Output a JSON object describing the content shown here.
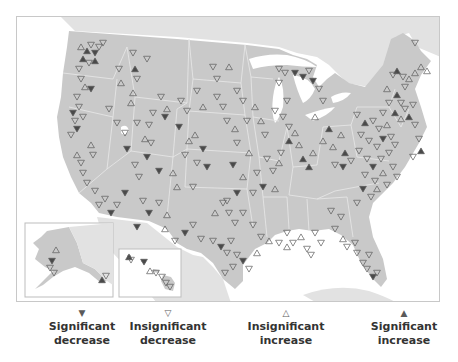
{
  "colors": {
    "land": "#c9c9c9",
    "neighbor_land": "#e2e2e2",
    "water": "#ffffff",
    "state_border": "#e8e8e8",
    "frame": "#c8c8c8",
    "marker_stroke": "#5a5a5a",
    "marker_fill_significant": "#4a4a4a"
  },
  "legend": {
    "items": [
      {
        "symbol": "▼",
        "line1": "Significant",
        "line2": "decrease",
        "type": "sig-dec"
      },
      {
        "symbol": "▽",
        "line1": "Insignificant",
        "line2": "decrease",
        "type": "insig-dec"
      },
      {
        "symbol": "△",
        "line1": "Insignificant",
        "line2": "increase",
        "type": "insig-inc"
      },
      {
        "symbol": "▲",
        "line1": "Significant",
        "line2": "increase",
        "type": "sig-inc"
      }
    ]
  },
  "insets": [
    {
      "name": "alaska",
      "x": 8,
      "y": 206,
      "w": 88,
      "h": 74
    },
    {
      "name": "hawaii",
      "x": 102,
      "y": 232,
      "w": 62,
      "h": 48
    }
  ],
  "markers": [
    {
      "x": 64,
      "y": 30,
      "t": "insig-inc"
    },
    {
      "x": 70,
      "y": 34,
      "t": "sig-inc"
    },
    {
      "x": 74,
      "y": 28,
      "t": "insig-dec"
    },
    {
      "x": 78,
      "y": 36,
      "t": "sig-dec"
    },
    {
      "x": 82,
      "y": 30,
      "t": "insig-dec"
    },
    {
      "x": 66,
      "y": 42,
      "t": "sig-inc"
    },
    {
      "x": 72,
      "y": 46,
      "t": "insig-dec"
    },
    {
      "x": 62,
      "y": 52,
      "t": "insig-dec"
    },
    {
      "x": 78,
      "y": 44,
      "t": "sig-inc"
    },
    {
      "x": 86,
      "y": 26,
      "t": "insig-dec"
    },
    {
      "x": 64,
      "y": 62,
      "t": "insig-dec"
    },
    {
      "x": 68,
      "y": 70,
      "t": "insig-inc"
    },
    {
      "x": 74,
      "y": 72,
      "t": "sig-dec"
    },
    {
      "x": 60,
      "y": 80,
      "t": "insig-dec"
    },
    {
      "x": 62,
      "y": 90,
      "t": "insig-dec"
    },
    {
      "x": 56,
      "y": 96,
      "t": "sig-dec"
    },
    {
      "x": 58,
      "y": 104,
      "t": "insig-dec"
    },
    {
      "x": 60,
      "y": 112,
      "t": "sig-dec"
    },
    {
      "x": 54,
      "y": 118,
      "t": "insig-dec"
    },
    {
      "x": 66,
      "y": 100,
      "t": "insig-dec"
    },
    {
      "x": 74,
      "y": 128,
      "t": "insig-inc"
    },
    {
      "x": 76,
      "y": 138,
      "t": "insig-dec"
    },
    {
      "x": 60,
      "y": 138,
      "t": "insig-inc"
    },
    {
      "x": 64,
      "y": 146,
      "t": "insig-dec"
    },
    {
      "x": 66,
      "y": 156,
      "t": "insig-dec"
    },
    {
      "x": 70,
      "y": 166,
      "t": "insig-dec"
    },
    {
      "x": 78,
      "y": 174,
      "t": "insig-dec"
    },
    {
      "x": 116,
      "y": 36,
      "t": "insig-dec"
    },
    {
      "x": 102,
      "y": 52,
      "t": "insig-dec"
    },
    {
      "x": 118,
      "y": 52,
      "t": "sig-inc"
    },
    {
      "x": 120,
      "y": 62,
      "t": "insig-dec"
    },
    {
      "x": 104,
      "y": 66,
      "t": "insig-inc"
    },
    {
      "x": 116,
      "y": 76,
      "t": "insig-inc"
    },
    {
      "x": 114,
      "y": 86,
      "t": "insig-inc"
    },
    {
      "x": 92,
      "y": 92,
      "t": "insig-dec"
    },
    {
      "x": 100,
      "y": 106,
      "t": "insig-dec"
    },
    {
      "x": 108,
      "y": 116,
      "t": "insig-dec"
    },
    {
      "x": 120,
      "y": 106,
      "t": "insig-dec"
    },
    {
      "x": 130,
      "y": 42,
      "t": "insig-dec"
    },
    {
      "x": 144,
      "y": 80,
      "t": "insig-dec"
    },
    {
      "x": 150,
      "y": 92,
      "t": "insig-inc"
    },
    {
      "x": 136,
      "y": 96,
      "t": "insig-dec"
    },
    {
      "x": 148,
      "y": 100,
      "t": "sig-dec"
    },
    {
      "x": 132,
      "y": 108,
      "t": "insig-dec"
    },
    {
      "x": 128,
      "y": 122,
      "t": "insig-inc"
    },
    {
      "x": 134,
      "y": 126,
      "t": "insig-dec"
    },
    {
      "x": 110,
      "y": 132,
      "t": "sig-dec"
    },
    {
      "x": 130,
      "y": 140,
      "t": "sig-dec"
    },
    {
      "x": 118,
      "y": 148,
      "t": "insig-dec"
    },
    {
      "x": 122,
      "y": 160,
      "t": "insig-dec"
    },
    {
      "x": 142,
      "y": 154,
      "t": "sig-dec"
    },
    {
      "x": 156,
      "y": 156,
      "t": "insig-inc"
    },
    {
      "x": 164,
      "y": 84,
      "t": "insig-dec"
    },
    {
      "x": 170,
      "y": 94,
      "t": "insig-dec"
    },
    {
      "x": 180,
      "y": 74,
      "t": "insig-dec"
    },
    {
      "x": 186,
      "y": 90,
      "t": "insig-inc"
    },
    {
      "x": 162,
      "y": 110,
      "t": "sig-dec"
    },
    {
      "x": 172,
      "y": 124,
      "t": "insig-inc"
    },
    {
      "x": 178,
      "y": 118,
      "t": "insig-inc"
    },
    {
      "x": 186,
      "y": 132,
      "t": "sig-dec"
    },
    {
      "x": 168,
      "y": 138,
      "t": "insig-dec"
    },
    {
      "x": 180,
      "y": 146,
      "t": "insig-dec"
    },
    {
      "x": 190,
      "y": 150,
      "t": "sig-dec"
    },
    {
      "x": 160,
      "y": 170,
      "t": "insig-inc"
    },
    {
      "x": 176,
      "y": 170,
      "t": "insig-dec"
    },
    {
      "x": 196,
      "y": 50,
      "t": "insig-dec"
    },
    {
      "x": 200,
      "y": 62,
      "t": "insig-dec"
    },
    {
      "x": 212,
      "y": 50,
      "t": "insig-inc"
    },
    {
      "x": 200,
      "y": 80,
      "t": "insig-dec"
    },
    {
      "x": 206,
      "y": 90,
      "t": "insig-dec"
    },
    {
      "x": 220,
      "y": 74,
      "t": "insig-dec"
    },
    {
      "x": 226,
      "y": 84,
      "t": "insig-dec"
    },
    {
      "x": 210,
      "y": 104,
      "t": "insig-dec"
    },
    {
      "x": 218,
      "y": 112,
      "t": "insig-inc"
    },
    {
      "x": 230,
      "y": 104,
      "t": "insig-dec"
    },
    {
      "x": 238,
      "y": 90,
      "t": "insig-inc"
    },
    {
      "x": 244,
      "y": 104,
      "t": "insig-inc"
    },
    {
      "x": 248,
      "y": 118,
      "t": "insig-dec"
    },
    {
      "x": 220,
      "y": 126,
      "t": "insig-dec"
    },
    {
      "x": 232,
      "y": 136,
      "t": "insig-inc"
    },
    {
      "x": 216,
      "y": 148,
      "t": "sig-dec"
    },
    {
      "x": 226,
      "y": 160,
      "t": "insig-inc"
    },
    {
      "x": 240,
      "y": 156,
      "t": "insig-dec"
    },
    {
      "x": 250,
      "y": 142,
      "t": "insig-dec"
    },
    {
      "x": 256,
      "y": 154,
      "t": "insig-dec"
    },
    {
      "x": 262,
      "y": 146,
      "t": "insig-inc"
    },
    {
      "x": 246,
      "y": 170,
      "t": "sig-dec"
    },
    {
      "x": 258,
      "y": 172,
      "t": "insig-inc"
    },
    {
      "x": 236,
      "y": 176,
      "t": "insig-dec"
    },
    {
      "x": 220,
      "y": 176,
      "t": "sig-dec"
    },
    {
      "x": 210,
      "y": 184,
      "t": "insig-dec"
    },
    {
      "x": 262,
      "y": 52,
      "t": "insig-dec"
    },
    {
      "x": 268,
      "y": 56,
      "t": "insig-dec"
    },
    {
      "x": 262,
      "y": 66,
      "t": "insig-dec"
    },
    {
      "x": 278,
      "y": 56,
      "t": "sig-dec"
    },
    {
      "x": 286,
      "y": 60,
      "t": "sig-dec"
    },
    {
      "x": 292,
      "y": 54,
      "t": "insig-dec"
    },
    {
      "x": 296,
      "y": 64,
      "t": "sig-dec"
    },
    {
      "x": 270,
      "y": 84,
      "t": "insig-dec"
    },
    {
      "x": 258,
      "y": 94,
      "t": "insig-dec"
    },
    {
      "x": 266,
      "y": 100,
      "t": "insig-dec"
    },
    {
      "x": 272,
      "y": 110,
      "t": "insig-dec"
    },
    {
      "x": 278,
      "y": 116,
      "t": "insig-inc"
    },
    {
      "x": 272,
      "y": 124,
      "t": "sig-inc"
    },
    {
      "x": 282,
      "y": 128,
      "t": "insig-inc"
    },
    {
      "x": 264,
      "y": 136,
      "t": "insig-dec"
    },
    {
      "x": 286,
      "y": 142,
      "t": "sig-inc"
    },
    {
      "x": 296,
      "y": 136,
      "t": "insig-inc"
    },
    {
      "x": 292,
      "y": 150,
      "t": "sig-inc"
    },
    {
      "x": 302,
      "y": 72,
      "t": "insig-dec"
    },
    {
      "x": 306,
      "y": 84,
      "t": "insig-dec"
    },
    {
      "x": 298,
      "y": 100,
      "t": "insig-inc"
    },
    {
      "x": 312,
      "y": 112,
      "t": "sig-inc"
    },
    {
      "x": 306,
      "y": 124,
      "t": "insig-inc"
    },
    {
      "x": 316,
      "y": 130,
      "t": "insig-inc"
    },
    {
      "x": 324,
      "y": 118,
      "t": "insig-inc"
    },
    {
      "x": 328,
      "y": 136,
      "t": "sig-inc"
    },
    {
      "x": 318,
      "y": 148,
      "t": "insig-dec"
    },
    {
      "x": 326,
      "y": 150,
      "t": "sig-dec"
    },
    {
      "x": 334,
      "y": 144,
      "t": "insig-dec"
    },
    {
      "x": 340,
      "y": 98,
      "t": "insig-dec"
    },
    {
      "x": 348,
      "y": 106,
      "t": "sig-inc"
    },
    {
      "x": 356,
      "y": 104,
      "t": "insig-dec"
    },
    {
      "x": 362,
      "y": 112,
      "t": "insig-dec"
    },
    {
      "x": 370,
      "y": 108,
      "t": "insig-inc"
    },
    {
      "x": 344,
      "y": 118,
      "t": "insig-dec"
    },
    {
      "x": 352,
      "y": 124,
      "t": "insig-dec"
    },
    {
      "x": 360,
      "y": 130,
      "t": "insig-dec"
    },
    {
      "x": 366,
      "y": 122,
      "t": "sig-dec"
    },
    {
      "x": 374,
      "y": 120,
      "t": "insig-dec"
    },
    {
      "x": 342,
      "y": 134,
      "t": "insig-dec"
    },
    {
      "x": 350,
      "y": 142,
      "t": "insig-dec"
    },
    {
      "x": 356,
      "y": 150,
      "t": "sig-dec"
    },
    {
      "x": 364,
      "y": 142,
      "t": "insig-dec"
    },
    {
      "x": 372,
      "y": 136,
      "t": "insig-dec"
    },
    {
      "x": 378,
      "y": 128,
      "t": "insig-dec"
    },
    {
      "x": 348,
      "y": 158,
      "t": "insig-dec"
    },
    {
      "x": 358,
      "y": 164,
      "t": "insig-dec"
    },
    {
      "x": 366,
      "y": 156,
      "t": "insig-inc"
    },
    {
      "x": 376,
      "y": 150,
      "t": "insig-dec"
    },
    {
      "x": 360,
      "y": 172,
      "t": "insig-inc"
    },
    {
      "x": 370,
      "y": 168,
      "t": "insig-dec"
    },
    {
      "x": 346,
      "y": 172,
      "t": "sig-dec"
    },
    {
      "x": 354,
      "y": 180,
      "t": "insig-dec"
    },
    {
      "x": 340,
      "y": 186,
      "t": "insig-dec"
    },
    {
      "x": 380,
      "y": 160,
      "t": "insig-dec"
    },
    {
      "x": 370,
      "y": 72,
      "t": "insig-inc"
    },
    {
      "x": 380,
      "y": 78,
      "t": "sig-inc"
    },
    {
      "x": 384,
      "y": 86,
      "t": "insig-dec"
    },
    {
      "x": 388,
      "y": 92,
      "t": "insig-dec"
    },
    {
      "x": 392,
      "y": 100,
      "t": "sig-inc"
    },
    {
      "x": 396,
      "y": 88,
      "t": "insig-dec"
    },
    {
      "x": 384,
      "y": 102,
      "t": "insig-inc"
    },
    {
      "x": 372,
      "y": 86,
      "t": "insig-dec"
    },
    {
      "x": 378,
      "y": 96,
      "t": "sig-inc"
    },
    {
      "x": 366,
      "y": 96,
      "t": "insig-dec"
    },
    {
      "x": 398,
      "y": 108,
      "t": "insig-dec"
    },
    {
      "x": 380,
      "y": 54,
      "t": "sig-inc"
    },
    {
      "x": 376,
      "y": 58,
      "t": "insig-dec"
    },
    {
      "x": 386,
      "y": 60,
      "t": "insig-dec"
    },
    {
      "x": 392,
      "y": 62,
      "t": "insig-inc"
    },
    {
      "x": 398,
      "y": 56,
      "t": "insig-inc"
    },
    {
      "x": 404,
      "y": 50,
      "t": "insig-inc"
    },
    {
      "x": 388,
      "y": 70,
      "t": "insig-dec"
    },
    {
      "x": 398,
      "y": 26,
      "t": "insig-dec"
    },
    {
      "x": 410,
      "y": 54,
      "t": "insig-inc"
    },
    {
      "x": 402,
      "y": 122,
      "t": "insig-dec"
    },
    {
      "x": 404,
      "y": 134,
      "t": "sig-inc"
    },
    {
      "x": 396,
      "y": 140,
      "t": "insig-dec"
    },
    {
      "x": 314,
      "y": 194,
      "t": "insig-dec"
    },
    {
      "x": 324,
      "y": 200,
      "t": "insig-dec"
    },
    {
      "x": 318,
      "y": 212,
      "t": "insig-dec"
    },
    {
      "x": 298,
      "y": 216,
      "t": "insig-dec"
    },
    {
      "x": 304,
      "y": 226,
      "t": "insig-dec"
    },
    {
      "x": 290,
      "y": 232,
      "t": "insig-dec"
    },
    {
      "x": 284,
      "y": 220,
      "t": "insig-inc"
    },
    {
      "x": 294,
      "y": 238,
      "t": "insig-dec"
    },
    {
      "x": 338,
      "y": 226,
      "t": "insig-dec"
    },
    {
      "x": 340,
      "y": 236,
      "t": "insig-dec"
    },
    {
      "x": 326,
      "y": 222,
      "t": "insig-inc"
    },
    {
      "x": 330,
      "y": 230,
      "t": "insig-dec"
    },
    {
      "x": 346,
      "y": 246,
      "t": "insig-dec"
    },
    {
      "x": 352,
      "y": 238,
      "t": "insig-dec"
    },
    {
      "x": 350,
      "y": 252,
      "t": "insig-dec"
    },
    {
      "x": 356,
      "y": 260,
      "t": "sig-dec"
    },
    {
      "x": 360,
      "y": 256,
      "t": "insig-dec"
    },
    {
      "x": 262,
      "y": 226,
      "t": "insig-dec"
    },
    {
      "x": 270,
      "y": 230,
      "t": "insig-inc"
    },
    {
      "x": 276,
      "y": 226,
      "t": "insig-dec"
    },
    {
      "x": 270,
      "y": 216,
      "t": "insig-dec"
    },
    {
      "x": 198,
      "y": 196,
      "t": "insig-inc"
    },
    {
      "x": 206,
      "y": 186,
      "t": "insig-dec"
    },
    {
      "x": 212,
      "y": 196,
      "t": "insig-dec"
    },
    {
      "x": 218,
      "y": 206,
      "t": "insig-dec"
    },
    {
      "x": 226,
      "y": 196,
      "t": "insig-dec"
    },
    {
      "x": 236,
      "y": 208,
      "t": "insig-dec"
    },
    {
      "x": 244,
      "y": 220,
      "t": "insig-dec"
    },
    {
      "x": 252,
      "y": 224,
      "t": "insig-inc"
    },
    {
      "x": 196,
      "y": 224,
      "t": "insig-dec"
    },
    {
      "x": 204,
      "y": 230,
      "t": "sig-dec"
    },
    {
      "x": 210,
      "y": 236,
      "t": "insig-dec"
    },
    {
      "x": 214,
      "y": 224,
      "t": "insig-dec"
    },
    {
      "x": 220,
      "y": 238,
      "t": "insig-dec"
    },
    {
      "x": 226,
      "y": 244,
      "t": "sig-dec"
    },
    {
      "x": 216,
      "y": 250,
      "t": "insig-dec"
    },
    {
      "x": 208,
      "y": 256,
      "t": "insig-dec"
    },
    {
      "x": 232,
      "y": 252,
      "t": "insig-dec"
    },
    {
      "x": 240,
      "y": 236,
      "t": "insig-inc"
    },
    {
      "x": 176,
      "y": 208,
      "t": "insig-dec"
    },
    {
      "x": 168,
      "y": 216,
      "t": "sig-dec"
    },
    {
      "x": 184,
      "y": 222,
      "t": "insig-dec"
    },
    {
      "x": 158,
      "y": 224,
      "t": "insig-dec"
    },
    {
      "x": 148,
      "y": 212,
      "t": "insig-inc"
    },
    {
      "x": 142,
      "y": 186,
      "t": "insig-dec"
    },
    {
      "x": 150,
      "y": 198,
      "t": "insig-inc"
    },
    {
      "x": 132,
      "y": 196,
      "t": "sig-dec"
    },
    {
      "x": 126,
      "y": 184,
      "t": "insig-dec"
    },
    {
      "x": 108,
      "y": 176,
      "t": "sig-dec"
    },
    {
      "x": 100,
      "y": 188,
      "t": "insig-dec"
    },
    {
      "x": 94,
      "y": 196,
      "t": "sig-dec"
    },
    {
      "x": 88,
      "y": 182,
      "t": "insig-dec"
    },
    {
      "x": 82,
      "y": 188,
      "t": "insig-dec"
    },
    {
      "x": 120,
      "y": 210,
      "t": "sig-dec"
    }
  ],
  "inset_markers": [
    {
      "x": 39,
      "y": 233,
      "t": "insig-inc"
    },
    {
      "x": 35,
      "y": 244,
      "t": "sig-dec"
    },
    {
      "x": 33,
      "y": 251,
      "t": "insig-dec"
    },
    {
      "x": 37,
      "y": 256,
      "t": "insig-dec"
    },
    {
      "x": 85,
      "y": 263,
      "t": "sig-inc"
    },
    {
      "x": 89,
      "y": 259,
      "t": "insig-dec"
    },
    {
      "x": 112,
      "y": 240,
      "t": "sig-inc"
    },
    {
      "x": 114,
      "y": 243,
      "t": "insig-dec"
    },
    {
      "x": 127,
      "y": 245,
      "t": "sig-dec"
    },
    {
      "x": 133,
      "y": 254,
      "t": "insig-inc"
    },
    {
      "x": 139,
      "y": 256,
      "t": "insig-dec"
    },
    {
      "x": 145,
      "y": 260,
      "t": "insig-dec"
    },
    {
      "x": 149,
      "y": 266,
      "t": "insig-dec"
    },
    {
      "x": 153,
      "y": 270,
      "t": "insig-dec"
    }
  ]
}
